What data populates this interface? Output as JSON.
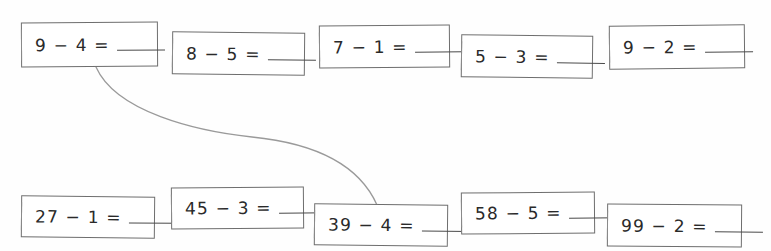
{
  "worksheet": {
    "title": "Subtraction matching worksheet",
    "background_color": "#ffffff",
    "ink_color": "#2a2a2a",
    "box_border_color": "#6e6e6e",
    "connector_color": "#9a9a9a",
    "blank_label": "answer blank"
  },
  "top_row": [
    {
      "expression": "9 − 4 =",
      "minuend": "9",
      "subtrahend": "4",
      "answer": ""
    },
    {
      "expression": "8 − 5 =",
      "minuend": "8",
      "subtrahend": "5",
      "answer": ""
    },
    {
      "expression": "7 − 1 =",
      "minuend": "7",
      "subtrahend": "1",
      "answer": ""
    },
    {
      "expression": "5 − 3 =",
      "minuend": "5",
      "subtrahend": "3",
      "answer": ""
    },
    {
      "expression": "9 − 2 =",
      "minuend": "9",
      "subtrahend": "2",
      "answer": ""
    }
  ],
  "bottom_row": [
    {
      "expression": "27 − 1 =",
      "minuend": "27",
      "subtrahend": "1",
      "answer": ""
    },
    {
      "expression": "45 − 3 =",
      "minuend": "45",
      "subtrahend": "3",
      "answer": ""
    },
    {
      "expression": "39 − 4 =",
      "minuend": "39",
      "subtrahend": "4",
      "answer": ""
    },
    {
      "expression": "58 − 5 =",
      "minuend": "58",
      "subtrahend": "5",
      "answer": ""
    },
    {
      "expression": "99 − 2 =",
      "minuend": "99",
      "subtrahend": "2",
      "answer": ""
    }
  ],
  "connectors": [
    {
      "from": "9 − 4 =",
      "to": "39 − 4 =",
      "path": "M 96,67 C 116,112 196,131 252,137 C 312,143 358,162 377,205"
    }
  ]
}
